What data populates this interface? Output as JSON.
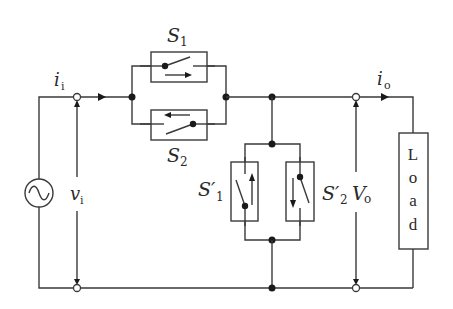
{
  "diagram": {
    "type": "circuit-schematic",
    "colors": {
      "line": "#3a3a3a",
      "node": "#1a1a1a",
      "background": "#ffffff"
    },
    "labels": {
      "input_current": {
        "main": "i",
        "sub": "i"
      },
      "output_current": {
        "main": "i",
        "sub": "o"
      },
      "input_voltage": {
        "main": "v",
        "sub": "i"
      },
      "output_voltage": {
        "main": "V",
        "sub": "o"
      },
      "s1": {
        "main": "S",
        "sub": "1"
      },
      "s2": {
        "main": "S",
        "sub": "2"
      },
      "s1_prime": {
        "main": "S′",
        "sub": "1"
      },
      "s2_prime": {
        "main": "S′",
        "sub": "2"
      },
      "load": [
        "L",
        "o",
        "a",
        "d"
      ]
    },
    "components": [
      {
        "id": "ac-source",
        "kind": "ac-voltage-source"
      },
      {
        "id": "s1",
        "kind": "switch",
        "current_direction": "right"
      },
      {
        "id": "s2",
        "kind": "switch",
        "current_direction": "left"
      },
      {
        "id": "s1-prime",
        "kind": "switch",
        "current_direction": "up"
      },
      {
        "id": "s2-prime",
        "kind": "switch",
        "current_direction": "down"
      },
      {
        "id": "load",
        "kind": "load"
      }
    ]
  }
}
